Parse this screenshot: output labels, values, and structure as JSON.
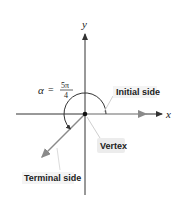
{
  "diagram": {
    "type": "angle-in-standard-position",
    "axes": {
      "x_label": "x",
      "y_label": "y"
    },
    "angle": {
      "symbol": "α",
      "equals": "=",
      "numerator": "5π",
      "denominator": "4"
    },
    "labels": {
      "initial_side": "Initial side",
      "vertex": "Vertex",
      "terminal_side": "Terminal side"
    },
    "colors": {
      "axis": "#333333",
      "side": "#9a9a9a",
      "label_bg": "#ececec",
      "text": "#222222"
    }
  }
}
